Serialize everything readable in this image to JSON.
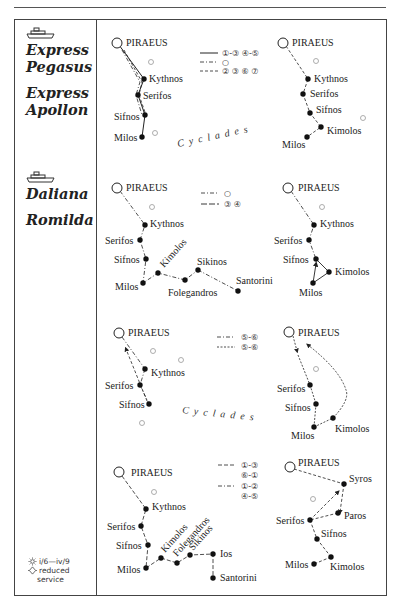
{
  "ships": [
    {
      "names": [
        "Express",
        "Pegasus",
        "Express",
        "Apollon"
      ],
      "icon": "ferry-icon"
    },
    {
      "names": [
        "Daliana",
        "Romilda"
      ],
      "icon": "ferry-icon"
    }
  ],
  "season_note": {
    "summer_icon": "sun-icon",
    "summer_dates": "i/6—iv/9",
    "reduced_icon": "reduced-service-icon",
    "reduced_line1": "reduced",
    "reduced_line2": "service"
  },
  "region_label": "Cyclades",
  "panels": [
    {
      "id": "p1",
      "ports": [
        "PIRAEUS",
        "Kythnos",
        "Serifos",
        "Sifnos",
        "Milos"
      ],
      "legend": [
        {
          "style": "solid",
          "days": "①-③ ④-⑤"
        },
        {
          "style": "dash-dot",
          "days": "○"
        },
        {
          "style": "dashed",
          "days": "② ③ ⑥ ⑦"
        }
      ]
    },
    {
      "id": "p2",
      "ports": [
        "PIRAEUS",
        "Kythnos",
        "Serifos",
        "Sifnos",
        "Kimolos",
        "Milos"
      ]
    },
    {
      "id": "p3",
      "ports": [
        "PIRAEUS",
        "Kythnos",
        "Serifos",
        "Sifnos",
        "Kimolos",
        "Sikinos",
        "Milos",
        "Folegandros",
        "Santorini"
      ],
      "legend": [
        {
          "style": "dash-dot",
          "days": "○"
        },
        {
          "style": "long-dash",
          "days": "③ ④"
        }
      ]
    },
    {
      "id": "p4",
      "ports": [
        "PIRAEUS",
        "Kythnos",
        "Serifos",
        "Sifnos",
        "Kimolos",
        "Milos"
      ]
    },
    {
      "id": "p5",
      "ports": [
        "PIRAEUS",
        "Kythnos",
        "Serifos",
        "Sifnos"
      ],
      "legend": [
        {
          "style": "dash-dot",
          "days": "⑤-⑥"
        },
        {
          "style": "dotted",
          "days": "⑤-⑥"
        }
      ]
    },
    {
      "id": "p6",
      "ports": [
        "PIRAEUS",
        "Serifos",
        "Sifnos",
        "Milos",
        "Kimolos"
      ]
    },
    {
      "id": "p7",
      "ports": [
        "PIRAEUS",
        "Kythnos",
        "Serifos",
        "Sifnos",
        "Kimolos",
        "Folegandros",
        "Sikinos",
        "Ios",
        "Milos",
        "Santorini"
      ],
      "legend": [
        {
          "style": "dashed",
          "days": "①-③",
          "days2": "⑥-①"
        },
        {
          "style": "dash-dot",
          "days": "①-②",
          "days2": "④-⑤"
        }
      ]
    },
    {
      "id": "p8",
      "ports": [
        "PIRAEUS",
        "Syros",
        "Paros",
        "Serifos",
        "Sifnos",
        "Milos",
        "Kimolos"
      ]
    }
  ]
}
